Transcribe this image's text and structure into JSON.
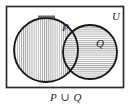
{
  "figure": {
    "kind": "venn-diagram",
    "caption": "P ∪ Q",
    "universe_label": "U",
    "set_p_label": "P",
    "set_q_label": "Q",
    "colors": {
      "ink": "#1a1a1a",
      "hatch": "#8c8c8c",
      "frame": "#2b2b2b",
      "background": "#ffffff"
    },
    "regions": {
      "p_only_shading": "vertical-hatch",
      "q_only_shading": "horizontal-hatch",
      "intersection_shading": "cross-hatch",
      "outside_shading": "none"
    },
    "geometry": {
      "frame": {
        "x": 6,
        "y": 6,
        "width": 118,
        "height": 82
      },
      "circle_p": {
        "cx": 46,
        "cy": 50,
        "r": 32
      },
      "circle_q": {
        "cx": 90,
        "cy": 52,
        "r": 27
      },
      "label_p": {
        "x": 62,
        "y": 29
      },
      "label_q": {
        "x": 97,
        "y": 45
      },
      "label_u": {
        "x": 114,
        "y": 18
      }
    }
  }
}
